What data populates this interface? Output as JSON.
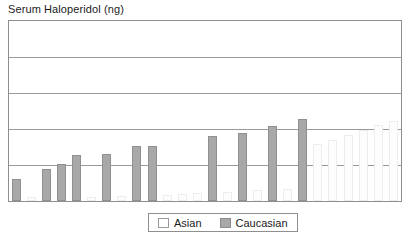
{
  "chart_data": {
    "type": "bar",
    "title": "Serum Haloperidol (ng)",
    "xlabel": "",
    "ylabel": "Serum Haloperidol (ng)",
    "grid": true,
    "gridline_count": 4,
    "legend_position": "bottom-center",
    "ylim": [
      0,
      5
    ],
    "yticks": [
      1,
      2,
      3,
      4
    ],
    "ytick_labels": [
      "",
      "",
      "",
      ""
    ],
    "xtick_labels": [],
    "legend": [
      {
        "name": "Asian",
        "color": "#ffffff",
        "border": "#9a9a9a"
      },
      {
        "name": "Caucasian",
        "color": "#a8a8a8",
        "border": "#909090"
      }
    ],
    "note": "Individual subjects sorted by ascending serum haloperidol level; each bar is one subject.",
    "bars": [
      {
        "index": 1,
        "group": "Caucasian",
        "value": 0.6
      },
      {
        "index": 2,
        "group": "Asian",
        "value": 0.1
      },
      {
        "index": 3,
        "group": "Caucasian",
        "value": 0.88
      },
      {
        "index": 4,
        "group": "Caucasian",
        "value": 1.02
      },
      {
        "index": 5,
        "group": "Caucasian",
        "value": 1.28
      },
      {
        "index": 6,
        "group": "Asian",
        "value": 0.12
      },
      {
        "index": 7,
        "group": "Caucasian",
        "value": 1.3
      },
      {
        "index": 8,
        "group": "Asian",
        "value": 0.14
      },
      {
        "index": 9,
        "group": "Caucasian",
        "value": 1.52
      },
      {
        "index": 10,
        "group": "Caucasian",
        "value": 1.52
      },
      {
        "index": 11,
        "group": "Asian",
        "value": 0.18
      },
      {
        "index": 12,
        "group": "Asian",
        "value": 0.2
      },
      {
        "index": 13,
        "group": "Asian",
        "value": 0.22
      },
      {
        "index": 14,
        "group": "Caucasian",
        "value": 1.8
      },
      {
        "index": 15,
        "group": "Asian",
        "value": 0.26
      },
      {
        "index": 16,
        "group": "Caucasian",
        "value": 1.88
      },
      {
        "index": 17,
        "group": "Asian",
        "value": 0.3
      },
      {
        "index": 18,
        "group": "Caucasian",
        "value": 2.08
      },
      {
        "index": 19,
        "group": "Asian",
        "value": 0.34
      },
      {
        "index": 20,
        "group": "Caucasian",
        "value": 2.28
      },
      {
        "index": 21,
        "group": "Asian",
        "value": 1.58
      },
      {
        "index": 22,
        "group": "Asian",
        "value": 1.7
      },
      {
        "index": 23,
        "group": "Asian",
        "value": 1.82
      },
      {
        "index": 24,
        "group": "Asian",
        "value": 1.96
      },
      {
        "index": 25,
        "group": "Asian",
        "value": 2.1
      },
      {
        "index": 26,
        "group": "Asian",
        "value": 2.22
      }
    ]
  }
}
